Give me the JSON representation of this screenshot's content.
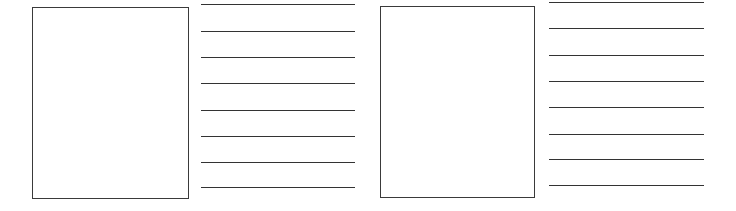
{
  "worksheet": {
    "panels": [
      {
        "id": "left",
        "box": {
          "x": 32,
          "y": 7,
          "w": 157,
          "h": 192
        },
        "lines": {
          "x": 201,
          "w": 154,
          "y": [
            4,
            31,
            57,
            83,
            110,
            136,
            162,
            187
          ]
        }
      },
      {
        "id": "right",
        "box": {
          "x": 380,
          "y": 6,
          "w": 155,
          "h": 192
        },
        "lines": {
          "x": 549,
          "w": 155,
          "y": [
            2,
            28,
            55,
            81,
            107,
            134,
            159,
            185
          ]
        }
      }
    ],
    "colors": {
      "background": "#ffffff",
      "box_border": "#3a3a3a",
      "line": "#333333"
    }
  }
}
